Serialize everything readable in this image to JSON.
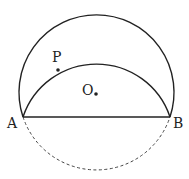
{
  "diagram": {
    "type": "geometry",
    "points": {
      "A": {
        "label": "A",
        "x": 23,
        "y": 117
      },
      "B": {
        "label": "B",
        "x": 170,
        "y": 117
      },
      "O": {
        "label": "O",
        "x": 96,
        "y": 94
      },
      "P": {
        "label": "P",
        "x": 58,
        "y": 70
      }
    },
    "elements": {
      "outer_circle": "solid upper arc of circle O",
      "chord": "segment AB",
      "folded_arc": "solid arc A-P-B (reflection of lower arc)",
      "lower_arc": "dashed lower arc of circle O"
    }
  }
}
